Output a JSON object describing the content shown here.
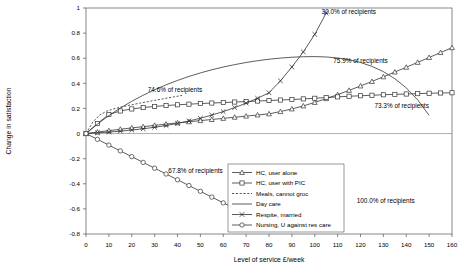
{
  "chart_data": {
    "type": "line",
    "title": "",
    "xlabel": "Level of service £/week",
    "ylabel": "Change in satisfaction",
    "xlim": [
      0,
      160
    ],
    "ylim": [
      -0.8,
      1.0
    ],
    "xticks": [
      0,
      10,
      20,
      30,
      40,
      50,
      60,
      70,
      80,
      90,
      100,
      110,
      120,
      130,
      140,
      150,
      160
    ],
    "yticks": [
      -0.8,
      -0.6,
      -0.4,
      -0.2,
      0,
      0.2,
      0.4,
      0.6,
      0.8,
      1
    ],
    "xtick_labels": [
      "0",
      "10",
      "20",
      "30",
      "40",
      "50",
      "60",
      "70",
      "80",
      "90",
      "100",
      "110",
      "120",
      "130",
      "140",
      "150",
      "160"
    ],
    "ytick_labels": [
      "-0.8",
      "-0.6",
      "-0.4",
      "-0.2",
      "0",
      "0.2",
      "0.4",
      "0.6",
      "0.8",
      "1"
    ],
    "grid": false,
    "legend_position": "inside-bottom-center",
    "series": [
      {
        "name": "HC, user alone",
        "marker": "triangle",
        "dash": "none",
        "x": [
          0,
          5,
          10,
          15,
          20,
          25,
          30,
          35,
          40,
          45,
          50,
          55,
          60,
          65,
          70,
          75,
          80,
          85,
          90,
          95,
          100,
          105,
          110,
          115,
          120,
          125,
          130,
          135,
          140,
          145,
          150,
          155,
          160
        ],
        "y": [
          0,
          0.012,
          0.023,
          0.034,
          0.045,
          0.055,
          0.065,
          0.075,
          0.085,
          0.094,
          0.103,
          0.112,
          0.121,
          0.13,
          0.139,
          0.148,
          0.157,
          0.175,
          0.196,
          0.22,
          0.248,
          0.278,
          0.31,
          0.344,
          0.379,
          0.415,
          0.452,
          0.49,
          0.528,
          0.567,
          0.606,
          0.645,
          0.684
        ]
      },
      {
        "name": "HC, user with PIC",
        "marker": "square",
        "dash": "none",
        "x": [
          0,
          5,
          10,
          15,
          20,
          25,
          30,
          35,
          40,
          45,
          50,
          55,
          60,
          65,
          70,
          75,
          80,
          85,
          90,
          95,
          100,
          105,
          110,
          115,
          120,
          125,
          130,
          135,
          140,
          145,
          150,
          155,
          160
        ],
        "y": [
          0,
          0.08,
          0.152,
          0.18,
          0.196,
          0.207,
          0.216,
          0.223,
          0.229,
          0.234,
          0.239,
          0.243,
          0.247,
          0.251,
          0.255,
          0.259,
          0.263,
          0.267,
          0.271,
          0.276,
          0.281,
          0.287,
          0.292,
          0.297,
          0.301,
          0.305,
          0.309,
          0.312,
          0.315,
          0.318,
          0.321,
          0.323,
          0.325
        ]
      },
      {
        "name": "Meals, cannot groc",
        "marker": "none",
        "dash": "dotted",
        "x": [
          0,
          3,
          6,
          9,
          12,
          15,
          18,
          21,
          24,
          27,
          30,
          33,
          36,
          39,
          42
        ],
        "y": [
          0,
          0.092,
          0.148,
          0.178,
          0.196,
          0.21,
          0.222,
          0.233,
          0.244,
          0.254,
          0.264,
          0.274,
          0.284,
          0.294,
          0.304
        ]
      },
      {
        "name": "Day care",
        "marker": "none",
        "dash": "none",
        "x": [
          0,
          5,
          10,
          15,
          20,
          25,
          30,
          35,
          40,
          45,
          50,
          55,
          60,
          65,
          70,
          75,
          80,
          85,
          90,
          95,
          100,
          105,
          110,
          115,
          120,
          125,
          130,
          135,
          140,
          145,
          150
        ],
        "y": [
          0,
          0.075,
          0.143,
          0.203,
          0.257,
          0.305,
          0.349,
          0.388,
          0.423,
          0.455,
          0.483,
          0.508,
          0.53,
          0.549,
          0.566,
          0.58,
          0.592,
          0.601,
          0.608,
          0.612,
          0.613,
          0.61,
          0.602,
          0.588,
          0.566,
          0.535,
          0.493,
          0.437,
          0.364,
          0.268,
          0.145
        ]
      },
      {
        "name": "Respite, married",
        "marker": "cross",
        "dash": "none",
        "x": [
          0,
          5,
          10,
          15,
          20,
          25,
          30,
          35,
          40,
          45,
          50,
          55,
          60,
          65,
          70,
          75,
          80,
          85,
          90,
          95,
          100,
          105
        ],
        "y": [
          0,
          0.006,
          0.012,
          0.019,
          0.028,
          0.038,
          0.05,
          0.064,
          0.081,
          0.1,
          0.122,
          0.147,
          0.175,
          0.207,
          0.242,
          0.281,
          0.325,
          0.42,
          0.53,
          0.65,
          0.79,
          0.96
        ]
      },
      {
        "name": "Nursing, U against res care",
        "marker": "circle",
        "dash": "none",
        "x": [
          0,
          5,
          10,
          15,
          20,
          25,
          30,
          35,
          40,
          45,
          50,
          55,
          60,
          65,
          70,
          75
        ],
        "y": [
          0,
          -0.046,
          -0.092,
          -0.138,
          -0.184,
          -0.23,
          -0.276,
          -0.322,
          -0.368,
          -0.414,
          -0.46,
          -0.506,
          -0.552,
          -0.598,
          -0.644,
          -0.69
        ]
      }
    ],
    "annotations": [
      {
        "text": "30.0% of recipients",
        "x": 103,
        "y": 0.955,
        "anchor": "start"
      },
      {
        "text": "75.9% of recipients",
        "x": 120,
        "y": 0.56,
        "anchor": "middle"
      },
      {
        "text": "74.6% of recipients",
        "x": 27,
        "y": 0.328,
        "anchor": "start"
      },
      {
        "text": "73.3% of recipients",
        "x": 138,
        "y": 0.2,
        "anchor": "middle"
      },
      {
        "text": "67.8% of recipients",
        "x": 36,
        "y": -0.318,
        "anchor": "start"
      },
      {
        "text": "100.0% of recipients",
        "x": 131,
        "y": -0.552,
        "anchor": "middle"
      }
    ]
  },
  "legend": {
    "items": [
      {
        "label": "HC, user alone",
        "marker": "triangle",
        "dash": "none"
      },
      {
        "label": "HC, user with PIC",
        "marker": "square",
        "dash": "none"
      },
      {
        "label": "Meals, cannot groc",
        "marker": "none",
        "dash": "dotted"
      },
      {
        "label": "Day care",
        "marker": "none",
        "dash": "none"
      },
      {
        "label": "Respite, married",
        "marker": "cross",
        "dash": "none"
      },
      {
        "label": "Nursing, U against res care",
        "marker": "circle",
        "dash": "none"
      }
    ]
  }
}
